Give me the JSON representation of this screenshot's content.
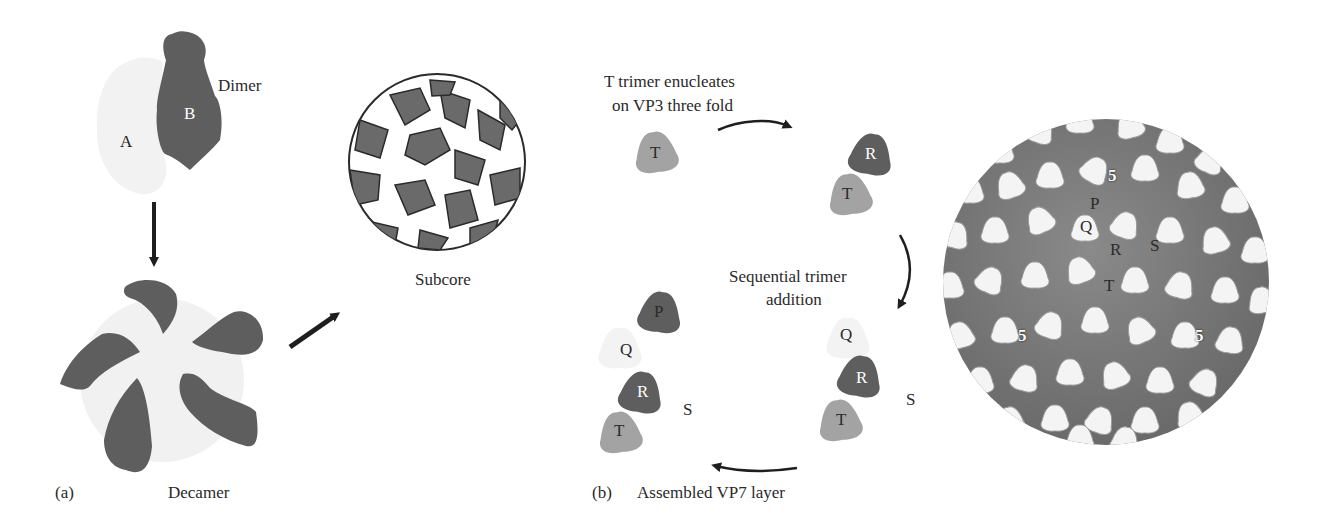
{
  "figure": {
    "panel_a": {
      "panel_label": "(a)",
      "dimer": {
        "label": "Dimer",
        "subunit_a": "A",
        "subunit_b": "B"
      },
      "decamer": {
        "label": "Decamer"
      },
      "subcore": {
        "label": "Subcore"
      }
    },
    "panel_b": {
      "panel_label": "(b)",
      "step1_caption_line1": "T trimer enucleates",
      "step1_caption_line2": "on VP3 three fold",
      "step2_caption_line1": "Sequential trimer",
      "step2_caption_line2": "addition",
      "step3_caption": "Assembled VP7 layer",
      "trimers": {
        "T": "T",
        "R": "R",
        "P": "P",
        "Q": "Q",
        "S": "S"
      },
      "particle_labels": {
        "fivefold": "5",
        "P": "P",
        "Q": "Q",
        "R": "R",
        "S": "S",
        "T": "T"
      }
    },
    "colors": {
      "dark_subunit": "#5e5e5e",
      "light_subunit": "#f0f0f0",
      "mid_trimer": "#a3a3a3",
      "arrow": "#1e1e1e",
      "outline": "#2a2a2a"
    }
  }
}
